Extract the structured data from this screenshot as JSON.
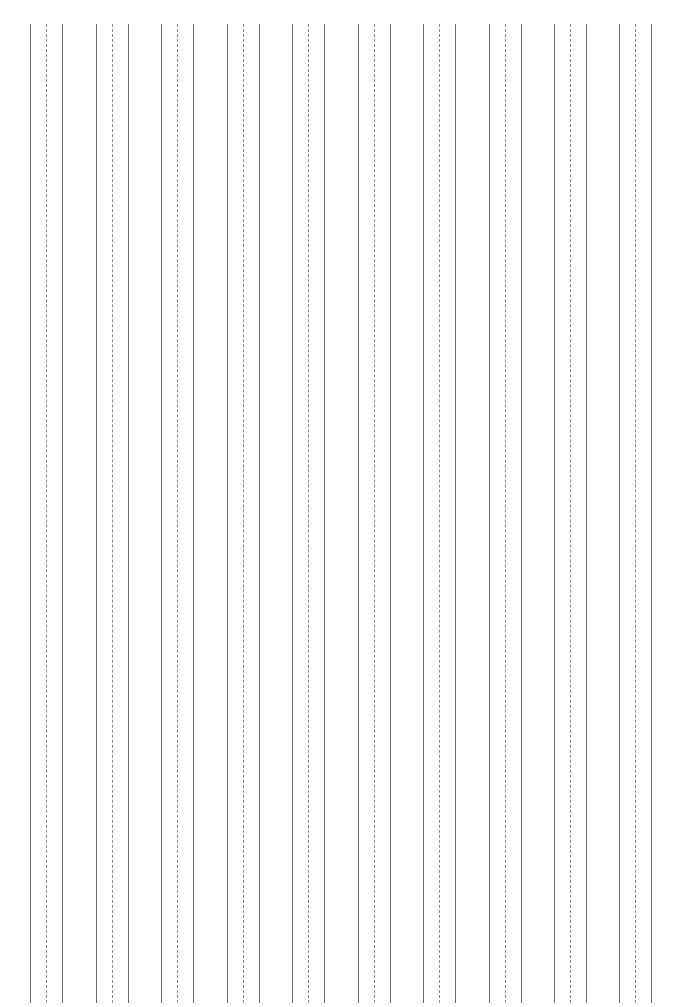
{
  "page": {
    "type": "ruled-paper",
    "orientation": "vertical-lines",
    "line_group_count": 10,
    "group_pattern": [
      "solid",
      "dashed",
      "solid"
    ],
    "line_color": "#6a6a6a",
    "dashed_color": "#8a8a8a",
    "background_color": "#ffffff"
  }
}
